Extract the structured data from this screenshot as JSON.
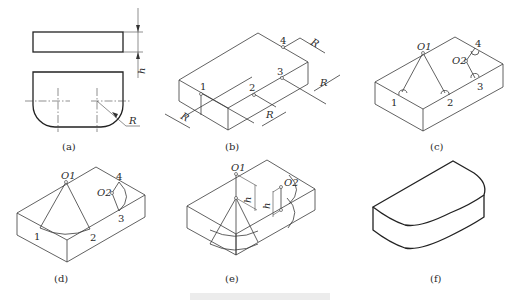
{
  "figure": {
    "panels": [
      {
        "id": "a",
        "label": "(a)",
        "annotations": {
          "height": "h",
          "radius": "R"
        }
      },
      {
        "id": "b",
        "label": "(b)",
        "points": [
          "1",
          "2",
          "3",
          "4"
        ],
        "annotations": {
          "radius": "R"
        }
      },
      {
        "id": "c",
        "label": "(c)",
        "points": [
          "1",
          "2",
          "3",
          "4"
        ],
        "centers": [
          "O1",
          "O2"
        ]
      },
      {
        "id": "d",
        "label": "(d)",
        "points": [
          "1",
          "2",
          "3",
          "4"
        ],
        "centers": [
          "O1",
          "O2"
        ]
      },
      {
        "id": "e",
        "label": "(e)",
        "centers": [
          "O1",
          "O2"
        ],
        "annotations": {
          "height": "h"
        }
      },
      {
        "id": "f",
        "label": "(f)"
      }
    ],
    "caption": ""
  }
}
